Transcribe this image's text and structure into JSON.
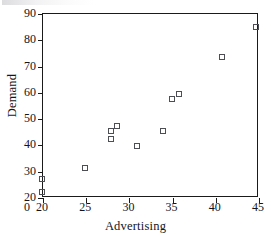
{
  "chart_data": {
    "type": "scatter",
    "title": "",
    "xlabel": "Advertising",
    "ylabel": "Demand",
    "xlim": [
      20,
      45
    ],
    "ylim": [
      20,
      90
    ],
    "xticks": [
      20,
      25,
      30,
      35,
      40,
      45
    ],
    "yticks": [
      20,
      30,
      40,
      50,
      60,
      70,
      80,
      90
    ],
    "origin_label": "0",
    "grid": false,
    "legend": "none",
    "marker": "open-square",
    "marker_color": "#4d4d55",
    "axis_color": "#1a1a1a",
    "background": "#ffffff",
    "points": [
      {
        "x": 20.0,
        "y": 27.0
      },
      {
        "x": 20.0,
        "y": 22.0
      },
      {
        "x": 25.0,
        "y": 31.0
      },
      {
        "x": 28.0,
        "y": 45.0
      },
      {
        "x": 28.0,
        "y": 42.0
      },
      {
        "x": 28.7,
        "y": 47.0
      },
      {
        "x": 31.0,
        "y": 39.5
      },
      {
        "x": 34.0,
        "y": 45.2
      },
      {
        "x": 35.0,
        "y": 57.3
      },
      {
        "x": 35.8,
        "y": 59.2
      },
      {
        "x": 40.8,
        "y": 73.2
      },
      {
        "x": 44.8,
        "y": 84.5
      }
    ]
  }
}
